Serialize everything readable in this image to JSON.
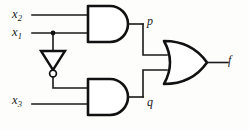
{
  "figure": {
    "name": "logic-circuit-diagram"
  },
  "labels": {
    "x2": {
      "base": "x",
      "sub": "2"
    },
    "x1": {
      "base": "x",
      "sub": "1"
    },
    "x3": {
      "base": "x",
      "sub": "3"
    },
    "p": "p",
    "q": "q",
    "f": "f"
  },
  "gates": [
    {
      "id": "and-top",
      "type": "AND",
      "inputs": [
        "x2",
        "x1"
      ],
      "output": "p"
    },
    {
      "id": "inverter",
      "type": "NOT",
      "inputs": [
        "x1"
      ],
      "output": "x1-bar"
    },
    {
      "id": "and-bottom",
      "type": "AND",
      "inputs": [
        "x1-bar",
        "x3"
      ],
      "output": "q"
    },
    {
      "id": "or-out",
      "type": "OR",
      "inputs": [
        "p",
        "q"
      ],
      "output": "f"
    }
  ],
  "colors": {
    "wire": "#1a1a1a",
    "gate_stroke": "#111111",
    "gate_fill": "#ffffff",
    "background": "#fdfdfc"
  }
}
